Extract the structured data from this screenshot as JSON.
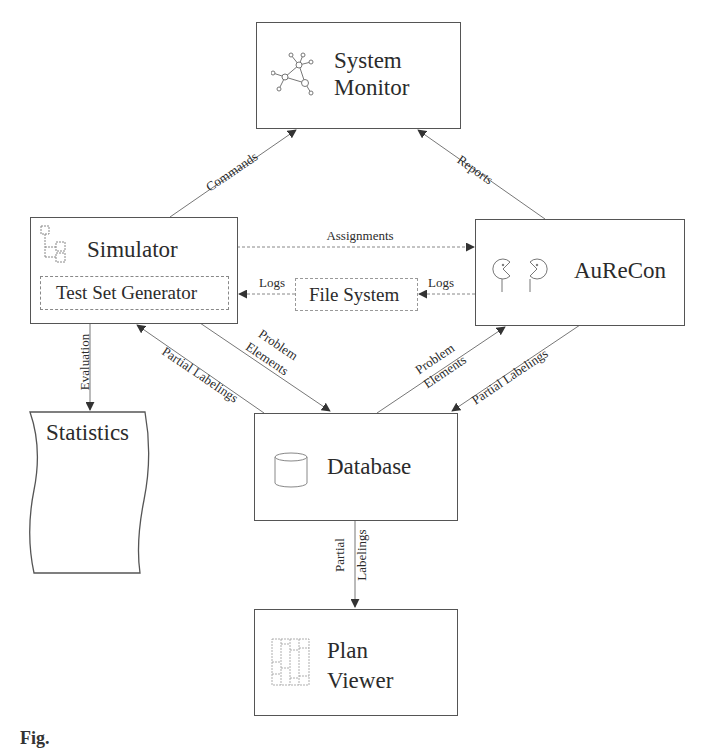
{
  "diagram": {
    "nodes": {
      "system_monitor": {
        "line1": "System",
        "line2": "Monitor",
        "icon": "network-graph-icon"
      },
      "simulator": {
        "label": "Simulator",
        "icon": "tree-hierarchy-icon",
        "sub": "Test Set Generator"
      },
      "aurecon": {
        "label": "AuReCon",
        "icon": "pacman-agents-icon"
      },
      "file_system": {
        "label": "File System"
      },
      "database": {
        "label": "Database",
        "icon": "database-cylinder-icon"
      },
      "statistics": {
        "label": "Statistics",
        "shape": "document"
      },
      "plan_viewer": {
        "line1": "Plan",
        "line2": "Viewer",
        "icon": "plan-grid-icon"
      }
    },
    "edges": {
      "commands": "Commands",
      "reports": "Reports",
      "assignments": "Assignments",
      "logs_fs_to_sim": "Logs",
      "logs_aur_to_fs": "Logs",
      "evaluation": "Evaluation",
      "partial_labelings_db_to_sim": "Partial Labelings",
      "problem_elements_sim_to_db_1": "Problem",
      "problem_elements_sim_to_db_2": "Elements",
      "problem_elements_db_to_aur_1": "Problem",
      "problem_elements_db_to_aur_2": "Elements",
      "partial_labelings_aur_to_db": "Partial Labelings",
      "partial_labelings_db_to_pv_1": "Partial",
      "partial_labelings_db_to_pv_2": "Labelings"
    },
    "caption_fragment": "Fig."
  }
}
